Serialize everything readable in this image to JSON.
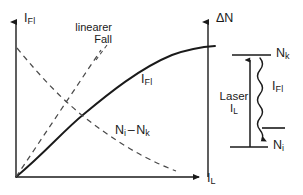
{
  "figure": {
    "background_color": "#ffffff",
    "line_color": "#1a1a1a"
  },
  "plot": {
    "y_axis_left": {
      "label_main": "I",
      "label_sub": "Fl"
    },
    "y_axis_right": {
      "label_main": "ΔN",
      "label_sub": ""
    },
    "x_axis": {
      "label_main": "I",
      "label_sub": "L"
    },
    "annotations": {
      "linear_case_line1": "linearer",
      "linear_case_line2": "Fall"
    },
    "curves": [
      {
        "name": "fluorescence-saturation-curve",
        "style": "solid",
        "label_main": "I",
        "label_sub": "Fl"
      },
      {
        "name": "population-difference-curve",
        "style": "dashed",
        "label_main": "N",
        "label_sub": "i",
        "label_main2": "N",
        "label_sub2": "k",
        "label_sep": "–"
      },
      {
        "name": "linear-case-line",
        "style": "dashed",
        "label_main": "linearer Fall",
        "label_sub": ""
      }
    ]
  },
  "level_scheme": {
    "upper_level": {
      "label_main": "N",
      "label_sub": "k"
    },
    "lower_level": {
      "label_main": "N",
      "label_sub": "i"
    },
    "pump_label_line1": "Laser",
    "pump_label_main": "I",
    "pump_label_sub": "L",
    "emission_label_main": "I",
    "emission_label_sub": "Fl"
  }
}
